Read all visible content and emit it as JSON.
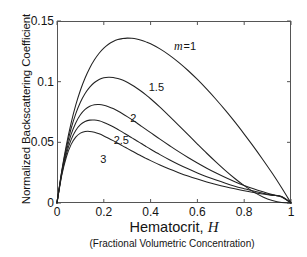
{
  "chart_data": {
    "type": "line",
    "title": "",
    "xlabel": "Hematocrit, H",
    "xsublabel": "(Fractional Volumetric Concentration)",
    "ylabel": "Normalized Backscattering Coefficient",
    "xlim": [
      0,
      1
    ],
    "ylim": [
      0,
      0.15
    ],
    "xticks": [
      "0",
      "0.2",
      "0.4",
      "0.6",
      "0.8",
      "1"
    ],
    "xtick_values": [
      0,
      0.2,
      0.4,
      0.6,
      0.8,
      1
    ],
    "yticks": [
      "0",
      "0.05",
      "0.1",
      "0.15"
    ],
    "ytick_values": [
      0,
      0.05,
      0.1,
      0.15
    ],
    "grid": false,
    "legend_position": "inline-annotations",
    "line_color": "#222222",
    "axis_color": "#555555",
    "background": "#ffffff",
    "x": [
      0,
      0.02,
      0.04,
      0.06,
      0.08,
      0.1,
      0.12,
      0.14,
      0.16,
      0.18,
      0.2,
      0.22,
      0.24,
      0.26,
      0.28,
      0.3,
      0.32,
      0.34,
      0.36,
      0.38,
      0.4,
      0.44,
      0.48,
      0.52,
      0.56,
      0.6,
      0.64,
      0.68,
      0.72,
      0.76,
      0.8,
      0.84,
      0.88,
      0.92,
      0.96,
      1
    ],
    "series": [
      {
        "name": "m = 1",
        "label": "m =1",
        "m": 1,
        "peak_x": 0.333,
        "peak_y": 0.148,
        "label_x": 0.5,
        "label_y": 0.129,
        "values": [
          0,
          0.0262,
          0.0478,
          0.0657,
          0.0806,
          0.0929,
          0.103,
          0.1113,
          0.118,
          0.1234,
          0.1276,
          0.1308,
          0.1331,
          0.1347,
          0.1355,
          0.1359,
          0.1357,
          0.1351,
          0.1341,
          0.1328,
          0.1312,
          0.127,
          0.1219,
          0.1159,
          0.1092,
          0.1018,
          0.0938,
          0.0853,
          0.0763,
          0.0668,
          0.0568,
          0.0465,
          0.0357,
          0.0245,
          0.0126,
          0
        ]
      },
      {
        "name": "m = 1.5",
        "label": "1.5",
        "m": 1.5,
        "peak_x": 0.27,
        "peak_y": 0.117,
        "label_x": 0.392,
        "label_y": 0.095,
        "values": [
          0,
          0.0255,
          0.0455,
          0.0612,
          0.0735,
          0.083,
          0.0902,
          0.0955,
          0.0993,
          0.1018,
          0.1032,
          0.1037,
          0.1035,
          0.1026,
          0.1013,
          0.0995,
          0.0973,
          0.0948,
          0.0921,
          0.0891,
          0.0859,
          0.079,
          0.0716,
          0.064,
          0.0563,
          0.0486,
          0.041,
          0.0337,
          0.0267,
          0.0202,
          0.0143,
          0.0092,
          0.005,
          0.0021,
          0.0004,
          0
        ]
      },
      {
        "name": "m = 2",
        "label": "2",
        "m": 2,
        "peak_x": 0.215,
        "peak_y": 0.086,
        "label_x": 0.313,
        "label_y": 0.0695,
        "values": [
          0,
          0.0245,
          0.0428,
          0.0563,
          0.066,
          0.0727,
          0.0771,
          0.0797,
          0.0809,
          0.0811,
          0.0806,
          0.0794,
          0.0778,
          0.0758,
          0.0736,
          0.0712,
          0.0687,
          0.0661,
          0.0634,
          0.0607,
          0.058,
          0.0526,
          0.0474,
          0.0423,
          0.0375,
          0.033,
          0.0287,
          0.0247,
          0.021,
          0.0176,
          0.0145,
          0.0117,
          0.0092,
          0.0069,
          0.005,
          0
        ]
      },
      {
        "name": "m = 2.5",
        "label": "2.5",
        "m": 2.5,
        "peak_x": 0.175,
        "peak_y": 0.0635,
        "label_x": 0.242,
        "label_y": 0.0515,
        "values": [
          0,
          0.0235,
          0.0403,
          0.052,
          0.0597,
          0.0645,
          0.0671,
          0.0683,
          0.0684,
          0.0677,
          0.0664,
          0.0647,
          0.0628,
          0.0606,
          0.0584,
          0.056,
          0.0537,
          0.0513,
          0.049,
          0.0466,
          0.0443,
          0.0399,
          0.0357,
          0.0318,
          0.0282,
          0.0248,
          0.0217,
          0.0189,
          0.0163,
          0.0139,
          0.0118,
          0.0098,
          0.0081,
          0.0065,
          0.0052,
          0
        ]
      },
      {
        "name": "m = 3",
        "label": "3",
        "m": 3,
        "peak_x": 0.145,
        "peak_y": 0.0475,
        "label_x": 0.185,
        "label_y": 0.0355,
        "values": [
          0,
          0.0226,
          0.0379,
          0.0481,
          0.0543,
          0.0576,
          0.0589,
          0.059,
          0.0583,
          0.057,
          0.0553,
          0.0534,
          0.0514,
          0.0493,
          0.0471,
          0.045,
          0.0429,
          0.0408,
          0.0388,
          0.0368,
          0.0349,
          0.0313,
          0.028,
          0.025,
          0.0222,
          0.0197,
          0.0174,
          0.0153,
          0.0134,
          0.0117,
          0.0101,
          0.0087,
          0.0074,
          0.0063,
          0.0053,
          0
        ]
      }
    ]
  }
}
